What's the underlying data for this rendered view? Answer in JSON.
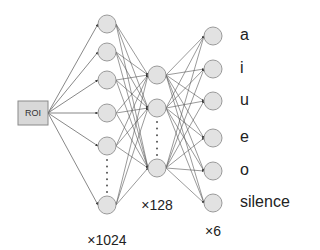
{
  "diagram": {
    "title": "",
    "input": {
      "label": "ROI",
      "box": {
        "x": 18,
        "y": 101,
        "w": 30,
        "h": 24
      }
    },
    "colors": {
      "node_fill": "#e2e2e2",
      "node_stroke": "#9a9a9a",
      "edge": "#555555",
      "input_fill": "#d8d8d8",
      "input_stroke": "#8a8a8a",
      "dots": "#555555"
    },
    "layers": [
      {
        "name": "hidden-1",
        "count_label": "×1024",
        "x": 107,
        "node_ys": [
          24,
          52,
          80,
          113,
          146,
          205
        ],
        "ellipsis": {
          "from": 160,
          "to": 192
        },
        "count_pos": {
          "x": 107,
          "y": 240
        }
      },
      {
        "name": "hidden-2",
        "count_label": "×128",
        "x": 157,
        "node_ys": [
          75,
          108,
          168
        ],
        "ellipsis": {
          "from": 122,
          "to": 155
        },
        "count_pos": {
          "x": 157,
          "y": 205
        }
      },
      {
        "name": "output",
        "count_label": "×6",
        "x": 213,
        "node_ys": [
          36,
          69,
          101,
          138,
          171,
          203
        ],
        "ellipsis": null,
        "count_pos": {
          "x": 213,
          "y": 231
        }
      }
    ],
    "node_radius": 9,
    "output_labels": [
      "a",
      "i",
      "u",
      "e",
      "o",
      "silence"
    ]
  }
}
